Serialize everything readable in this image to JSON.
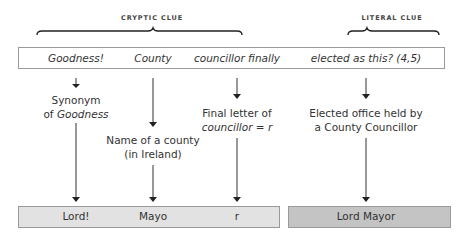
{
  "headers": {
    "cryptic": "CRYPTIC CLUE",
    "literal": "LITERAL CLUE"
  },
  "clue_parts": [
    {
      "text": "Goodness!",
      "x": 76
    },
    {
      "text": "County",
      "x": 153
    },
    {
      "text": "councillor finally",
      "x": 237
    },
    {
      "text": "elected as this? (4,5)",
      "x": 366
    }
  ],
  "explanations": {
    "goodness": {
      "line1": "Synonym",
      "line2_prefix": "of ",
      "line2_italic": "Goodness"
    },
    "county": {
      "line1": "Name of a county",
      "line2": "(in Ireland)"
    },
    "councillor": {
      "line1": "Final letter of",
      "line2_italic": "councillor",
      "line2_suffix": " = r"
    },
    "literal": {
      "line1": "Elected office held by",
      "line2": "a County Councillor"
    }
  },
  "answers": {
    "lord": "Lord!",
    "mayo": "Mayo",
    "r": "r",
    "full": "Lord Mayor"
  },
  "colors": {
    "answer_box_light": "#e2e2e2",
    "answer_box_dark": "#c4c4c4",
    "border": "#9a9a9a",
    "line": "#333333"
  }
}
